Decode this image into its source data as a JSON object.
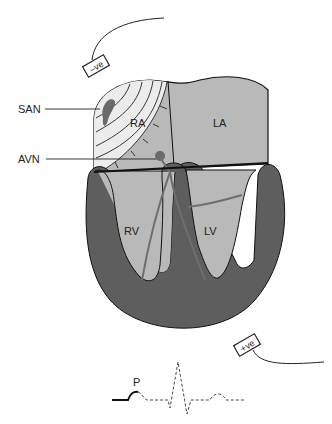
{
  "diagram": {
    "labels": {
      "san": "SAN",
      "avn": "AVN",
      "ra": "RA",
      "la": "LA",
      "rv": "RV",
      "lv": "LV",
      "p_wave": "P"
    },
    "electrodes": {
      "negative": "–ve",
      "positive": "+ve"
    },
    "colors": {
      "chamber_fill": "#b9b9b9",
      "muscle_fill": "#5e5e5e",
      "depolarisation_fill": "#ececec",
      "node_fill": "#6a6a6a",
      "outline": "#111111"
    }
  }
}
